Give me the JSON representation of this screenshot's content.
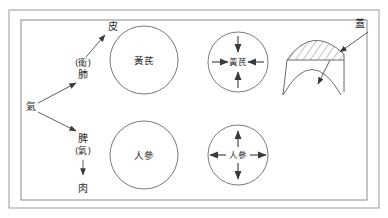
{
  "figure": {
    "title": "",
    "frame": {
      "border_color": "#8a8a8a",
      "background": "#ffffff"
    },
    "stroke_color": "#4a4a4a",
    "text_color": "#2b2b2b"
  },
  "qi_flow": {
    "source_label": "氣",
    "upper_branch": {
      "modifier_label": "(衛)",
      "organ_label": "肺",
      "target_label": "皮"
    },
    "lower_branch": {
      "organ_label": "脾",
      "modifier_label": "(氣)",
      "target_label": "肉"
    }
  },
  "herb_circles": {
    "large_top": {
      "label": "黃芪"
    },
    "large_bottom": {
      "label": "人參"
    },
    "arrows_top": {
      "label": "黃芪",
      "direction": "inward",
      "arrow_count": 4
    },
    "arrows_bottom": {
      "label": "人參",
      "direction": "outward",
      "arrow_count": 4
    }
  },
  "dome": {
    "label": "蓋",
    "hatched": true
  }
}
